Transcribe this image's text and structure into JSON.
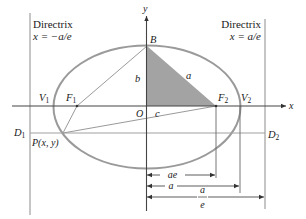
{
  "colors": {
    "ellipse": "#9a9a9a",
    "lines": "#555555",
    "thin": "#9a9a9a",
    "shade": "#9c9c9c",
    "text": "#1a1a1a"
  },
  "axes": {
    "x_label": "x",
    "y_label": "y",
    "origin_label": "O"
  },
  "directrix_left": {
    "title": "Directrix",
    "equation": "x = −a/e"
  },
  "directrix_right": {
    "title": "Directrix",
    "equation": "x = a/e"
  },
  "points": {
    "B": "B",
    "V1": "V",
    "V1_sub": "1",
    "V2": "V",
    "V2_sub": "2",
    "F1": "F",
    "F1_sub": "1",
    "F2": "F",
    "F2_sub": "2",
    "D1": "D",
    "D1_sub": "1",
    "D2": "D",
    "D2_sub": "2",
    "P": "P(x, y)"
  },
  "triangle_labels": {
    "b": "b",
    "a": "a",
    "c": "c"
  },
  "dimensions": {
    "ae": "ae",
    "a": "a",
    "a_over_e_num": "a",
    "a_over_e_den": "e"
  }
}
